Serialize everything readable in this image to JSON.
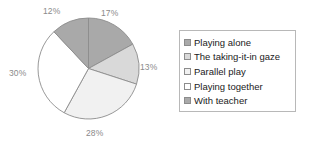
{
  "chart_data": {
    "type": "pie",
    "title": "",
    "categories": [
      "Playing alone",
      "The taking-it-in gaze",
      "Parallel play",
      "Playing together",
      "With teacher"
    ],
    "values": [
      17,
      13,
      28,
      30,
      12
    ],
    "value_labels": [
      "17%",
      "13%",
      "28%",
      "30%",
      "12%"
    ],
    "colors": [
      "#a9a9a9",
      "#d9d9d9",
      "#f1f1f1",
      "#ffffff",
      "#a9a9a9"
    ],
    "slice_border_color": "#8c8c8c",
    "start_angle_deg": 0,
    "direction": "clockwise",
    "legend": {
      "position": "right",
      "border_color": "#b8b8b8",
      "entries": [
        {
          "label": "Playing alone",
          "color": "#a9a9a9"
        },
        {
          "label": "The taking-it-in gaze",
          "color": "#d9d9d9"
        },
        {
          "label": "Parallel play",
          "color": "#f1f1f1"
        },
        {
          "label": "Playing together",
          "color": "#ffffff"
        },
        {
          "label": "With teacher",
          "color": "#a9a9a9"
        }
      ]
    },
    "label_color": "#8a8a8a",
    "grid": false,
    "xlabel": "",
    "ylabel": ""
  },
  "pie": {
    "labels": {
      "playing_alone": "17%",
      "taking_it_in_gaze": "13%",
      "parallel_play": "28%",
      "playing_together": "30%",
      "with_teacher": "12%"
    }
  },
  "legend": {
    "items": [
      {
        "label": "Playing alone"
      },
      {
        "label": "The taking-it-in gaze"
      },
      {
        "label": "Parallel play"
      },
      {
        "label": "Playing together"
      },
      {
        "label": "With teacher"
      }
    ]
  }
}
